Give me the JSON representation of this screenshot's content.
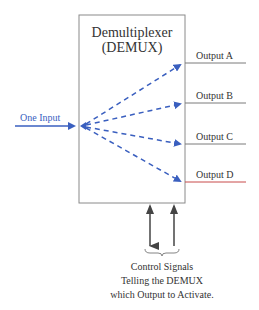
{
  "diagram": {
    "title_line1": "Demultiplexer",
    "title_line2": "(DEMUX)",
    "input_label": "One Input",
    "outputs": [
      {
        "label": "Output A"
      },
      {
        "label": "Output B"
      },
      {
        "label": "Output C"
      },
      {
        "label": "Output D"
      }
    ],
    "control": {
      "line1": "Control Signals",
      "line2": "Telling the DEMUX",
      "line3": "which Output to Activate."
    },
    "colors": {
      "box": "#8a8a8a",
      "signal": "#3a5fbf",
      "text": "#333333",
      "arrow": "#444444",
      "output_d_line": "#c84a4a"
    }
  }
}
